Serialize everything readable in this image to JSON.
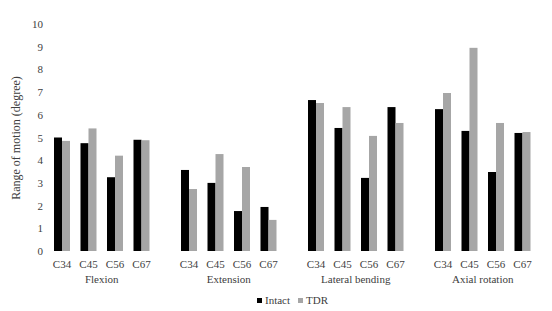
{
  "chart_data": {
    "type": "bar",
    "title": "",
    "xlabel": "",
    "ylabel": "Range of motion (degree)",
    "ylim": [
      0,
      10
    ],
    "yticks": [
      0,
      1,
      2,
      3,
      4,
      5,
      6,
      7,
      8,
      9,
      10
    ],
    "grid": false,
    "legend_position": "bottom",
    "groups": [
      {
        "name": "Flexion",
        "categories": [
          "C34",
          "C45",
          "C56",
          "C67"
        ]
      },
      {
        "name": "Extension",
        "categories": [
          "C34",
          "C45",
          "C56",
          "C67"
        ]
      },
      {
        "name": "Lateral bending",
        "categories": [
          "C34",
          "C45",
          "C56",
          "C67"
        ]
      },
      {
        "name": "Axial rotation",
        "categories": [
          "C34",
          "C45",
          "C56",
          "C67"
        ]
      }
    ],
    "series": [
      {
        "name": "Intact",
        "color": "#000000",
        "values": [
          [
            5.0,
            4.75,
            3.25,
            4.9
          ],
          [
            3.57,
            3.0,
            1.76,
            1.94
          ],
          [
            6.65,
            5.42,
            3.22,
            6.34
          ],
          [
            6.25,
            5.29,
            3.48,
            5.2
          ]
        ]
      },
      {
        "name": "TDR",
        "color": "#a6a6a6",
        "values": [
          [
            4.85,
            5.4,
            4.2,
            4.88
          ],
          [
            2.73,
            4.27,
            3.7,
            1.37
          ],
          [
            6.52,
            6.34,
            5.07,
            5.64
          ],
          [
            6.96,
            8.95,
            5.64,
            5.24
          ]
        ]
      }
    ]
  },
  "legend": {
    "items": [
      {
        "label": "Intact",
        "color": "#000000"
      },
      {
        "label": "TDR",
        "color": "#a6a6a6"
      }
    ]
  }
}
